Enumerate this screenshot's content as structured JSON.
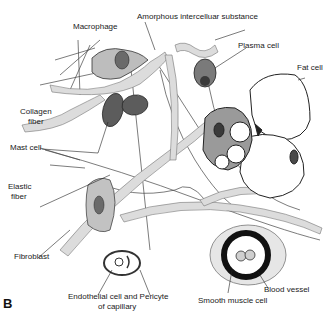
{
  "figure": {
    "panel_label": "B",
    "colors": {
      "ink": "#222222",
      "fiber_fill": "#d9d9d9",
      "cell_fill": "#8a8a8a",
      "nucleus": "#3a3a3a",
      "background": "#ffffff"
    }
  },
  "labels": {
    "amorphous": "Amorphous intercelluar substance",
    "macrophage": "Macrophage",
    "plasma_cell": "Plasma cell",
    "fat_cell": "Fat cell",
    "collagen_1": "Collagen",
    "collagen_2": "fiber",
    "mast_cell": "Mast cell",
    "elastic_1": "Elastic",
    "elastic_2": "fiber",
    "fibroblast": "Fibroblast",
    "endothelial_1": "Endothelial cell and Pericyte",
    "endothelial_2": "of capillary",
    "smooth_muscle": "Smooth muscle cell",
    "blood_vessel": "Blood vessel"
  }
}
